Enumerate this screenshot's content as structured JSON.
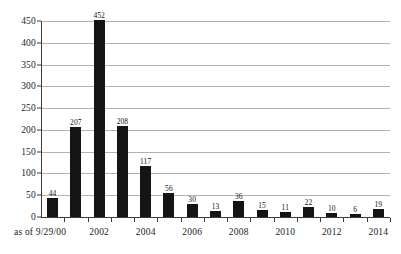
{
  "chart_data": {
    "type": "bar",
    "title": "",
    "subtitle": "",
    "xlabel": "",
    "ylabel": "",
    "ylim": [
      0,
      450
    ],
    "ytick_step": 50,
    "yticks": [
      0,
      50,
      100,
      150,
      200,
      250,
      300,
      350,
      400,
      450
    ],
    "grid": true,
    "legend": false,
    "legend_position": "none",
    "bar_color": "#141414",
    "gridline_color": "#b2b2b2",
    "axis_color": "#3c3c3c",
    "categories": [
      "as of 9/29/00",
      "2001",
      "2002",
      "2003",
      "2004",
      "2005",
      "2006",
      "2007",
      "2008",
      "2009",
      "2010",
      "2011",
      "2012",
      "2013",
      "2014"
    ],
    "xtick_labels": [
      "as of 9/29/00",
      "2002",
      "2004",
      "2006",
      "2008",
      "2010",
      "2012",
      "2014"
    ],
    "values": [
      44,
      207,
      452,
      208,
      117,
      56,
      30,
      13,
      36,
      15,
      11,
      22,
      10,
      6,
      19
    ],
    "data_labels": [
      "44",
      "207",
      "452",
      "208",
      "117",
      "56",
      "30",
      "13",
      "36",
      "15",
      "11",
      "22",
      "10",
      "6",
      "19"
    ]
  }
}
